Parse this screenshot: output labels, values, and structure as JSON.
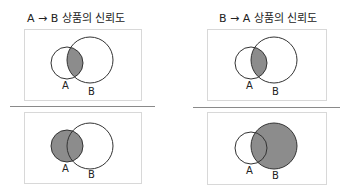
{
  "panels": {
    "left": {
      "title": "A → B 상품의 신뢰도",
      "top_diagram": {
        "shaded": "intersection",
        "label_a": "A",
        "label_b": "B"
      },
      "bottom_diagram": {
        "shaded": "A",
        "label_a": "A",
        "label_b": "B"
      }
    },
    "right": {
      "title": "B → A 상품의 신뢰도",
      "top_diagram": {
        "shaded": "intersection",
        "label_a": "A",
        "label_b": "B"
      },
      "bottom_diagram": {
        "shaded": "B",
        "label_a": "A",
        "label_b": "B"
      }
    }
  },
  "colors": {
    "shade": "#8c8c8c",
    "stroke": "#333333",
    "box_border": "#d8d8d8",
    "separator": "#8a8a8a"
  }
}
